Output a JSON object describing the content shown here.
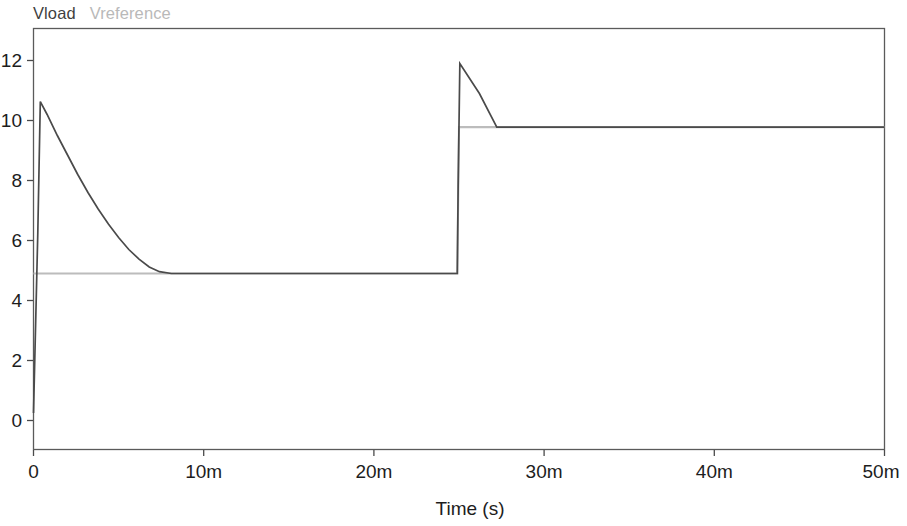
{
  "legend": {
    "entries": [
      {
        "label": "Vload",
        "color": "#4a4a4a"
      },
      {
        "label": "Vreference",
        "color": "#bcbcbc"
      }
    ]
  },
  "axes": {
    "x_title": "Time (s)",
    "y_title": "",
    "x_ticks": [
      "0",
      "10m",
      "20m",
      "30m",
      "40m",
      "50m"
    ],
    "y_ticks": [
      "0",
      "2",
      "4",
      "6",
      "8",
      "10",
      "12"
    ]
  },
  "chart_data": {
    "type": "line",
    "title": "",
    "subtitle": "",
    "xlabel": "Time (s)",
    "ylabel": "",
    "xlim": [
      0,
      0.05
    ],
    "ylim": [
      0,
      13
    ],
    "xtick_values": [
      0,
      0.01,
      0.02,
      0.03,
      0.04,
      0.05
    ],
    "xtick_labels": [
      "0",
      "10m",
      "20m",
      "30m",
      "40m",
      "50m"
    ],
    "ytick_values": [
      0,
      2,
      4,
      6,
      8,
      10,
      12
    ],
    "ytick_labels": [
      "0",
      "2",
      "4",
      "6",
      "8",
      "10",
      "12"
    ],
    "grid": false,
    "legend_position": "above-top-left",
    "series": [
      {
        "name": "Vload",
        "color": "#4a4a4a",
        "points": [
          [
            0.0,
            0.25
          ],
          [
            0.00025,
            6.2
          ],
          [
            0.0004,
            10.63
          ],
          [
            0.0008,
            10.2
          ],
          [
            0.0014,
            9.5
          ],
          [
            0.002,
            8.85
          ],
          [
            0.0026,
            8.2
          ],
          [
            0.0032,
            7.6
          ],
          [
            0.0038,
            7.05
          ],
          [
            0.0044,
            6.55
          ],
          [
            0.005,
            6.1
          ],
          [
            0.0056,
            5.7
          ],
          [
            0.0062,
            5.38
          ],
          [
            0.0068,
            5.12
          ],
          [
            0.0074,
            4.96
          ],
          [
            0.0081,
            4.9
          ],
          [
            0.0249,
            4.9
          ],
          [
            0.02495,
            7.8
          ],
          [
            0.02505,
            11.9
          ],
          [
            0.0262,
            10.9
          ],
          [
            0.02722,
            9.78
          ],
          [
            0.03,
            9.78
          ],
          [
            0.05,
            9.78
          ]
        ]
      },
      {
        "name": "Vreference",
        "color": "#bcbcbc",
        "points": [
          [
            0.0,
            4.9
          ],
          [
            0.0249,
            4.9
          ],
          [
            0.025,
            9.78
          ],
          [
            0.05,
            9.78
          ]
        ]
      }
    ],
    "annotations": [
      {
        "text": "initial overshoot peak",
        "x": 0.0004,
        "y": 10.63
      },
      {
        "text": "step transition",
        "x": 0.025,
        "y": 9.78
      },
      {
        "text": "step overshoot peak",
        "x": 0.02505,
        "y": 11.9
      }
    ]
  }
}
